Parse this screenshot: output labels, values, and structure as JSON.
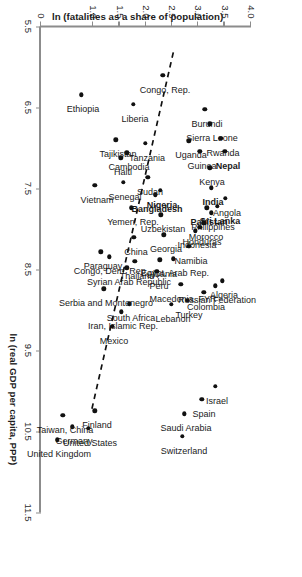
{
  "chart_data": {
    "type": "scatter",
    "title": "",
    "xlabel": "ln (real GDP per capita, PPP)",
    "ylabel": "ln (fatalities as a share of population)",
    "xlim": [
      5.5,
      11.5
    ],
    "ylim": [
      0,
      4.0
    ],
    "xticks": [
      "5.5",
      "6.5",
      "7.5",
      "8.5",
      "9.5",
      "10.5",
      "11.5"
    ],
    "xtick_values": [
      5.5,
      6.5,
      7.5,
      8.5,
      9.5,
      10.5,
      11.5
    ],
    "yticks": [
      "0",
      "1.0",
      "1.5",
      "2.0",
      "2.5",
      "3.0",
      "3.5",
      "4.0"
    ],
    "ytick_values": [
      0,
      1.0,
      1.5,
      2.0,
      2.5,
      3.0,
      3.5,
      4.0
    ],
    "grid": false,
    "legend": "none",
    "trendline": {
      "style": "dashed",
      "x_start": 5.82,
      "y_start": 2.52,
      "x_end": 10.22,
      "y_end": 0.97
    },
    "points": [
      {
        "label": "Burundi",
        "x": 6.52,
        "y": 3.12,
        "lx": 10,
        "ly": -2,
        "bold": false
      },
      {
        "label": "Sierra Leone",
        "x": 6.7,
        "y": 3.22,
        "lx": 10,
        "ly": -2,
        "bold": false
      },
      {
        "label": "Rwanda",
        "x": 6.88,
        "y": 3.43,
        "lx": 10,
        "ly": -2,
        "bold": false
      },
      {
        "label": "Nepal",
        "x": 7.04,
        "y": 3.5,
        "lx": 10,
        "ly": -3,
        "bold": true
      },
      {
        "label": "Uganda",
        "x": 6.91,
        "y": 2.82,
        "lx": 10,
        "ly": -2,
        "bold": false
      },
      {
        "label": "Guinea",
        "x": 7.04,
        "y": 3.02,
        "lx": 10,
        "ly": -2,
        "bold": false
      },
      {
        "label": "Kenya",
        "x": 7.24,
        "y": 3.22,
        "lx": 10,
        "ly": -2,
        "bold": false
      },
      {
        "label": "India",
        "x": 7.49,
        "y": 3.24,
        "lx": 10,
        "ly": -2,
        "bold": true
      },
      {
        "label": "Angola",
        "x": 7.62,
        "y": 3.51,
        "lx": 10,
        "ly": -2,
        "bold": false
      },
      {
        "label": "Sri Lanka",
        "x": 7.72,
        "y": 3.36,
        "lx": 10,
        "ly": -3,
        "bold": true
      },
      {
        "label": "Philippines",
        "x": 7.8,
        "y": 3.24,
        "lx": 10,
        "ly": -2,
        "bold": false
      },
      {
        "label": "Pakistan",
        "x": 7.74,
        "y": 3.16,
        "lx": 10,
        "ly": -2,
        "bold": true
      },
      {
        "label": "Morocco",
        "x": 7.92,
        "y": 3.1,
        "lx": 10,
        "ly": -2,
        "bold": false
      },
      {
        "label": "Honduras",
        "x": 7.98,
        "y": 3.02,
        "lx": 10,
        "ly": -2,
        "bold": false
      },
      {
        "label": "Indonesia",
        "x": 8.02,
        "y": 2.94,
        "lx": 10,
        "ly": -2,
        "bold": false
      },
      {
        "label": "Algeria",
        "x": 8.64,
        "y": 3.45,
        "lx": 10,
        "ly": -2,
        "bold": false
      },
      {
        "label": "Russian Federation",
        "x": 8.7,
        "y": 3.32,
        "lx": 10,
        "ly": -2,
        "bold": false
      },
      {
        "label": "Colombia",
        "x": 8.78,
        "y": 3.1,
        "lx": 10,
        "ly": -2,
        "bold": false
      },
      {
        "label": "Israel",
        "x": 9.94,
        "y": 3.32,
        "lx": 10,
        "ly": -2,
        "bold": false
      },
      {
        "label": "Spain",
        "x": 10.1,
        "y": 3.06,
        "lx": 10,
        "ly": -2,
        "bold": false
      },
      {
        "label": "Saudi Arabia",
        "x": 10.28,
        "y": 2.73,
        "lx": 10,
        "ly": -2,
        "bold": false
      },
      {
        "label": "Switzerland",
        "x": 10.56,
        "y": 2.69,
        "lx": 10,
        "ly": -2,
        "bold": false
      },
      {
        "label": "Namibia",
        "x": 8.21,
        "y": 2.82,
        "lx": 10,
        "ly": -2,
        "bold": false
      },
      {
        "label": "Turkey",
        "x": 8.88,
        "y": 2.79,
        "lx": 10,
        "ly": -2,
        "bold": false
      },
      {
        "label": "Macedonia, FYR",
        "x": 8.68,
        "y": 2.66,
        "lx": 10,
        "ly": -2,
        "bold": false
      },
      {
        "label": "Lebanon",
        "x": 8.93,
        "y": 2.48,
        "lx": 10,
        "ly": -2,
        "bold": false
      },
      {
        "label": "Egypt, Arab Rep.",
        "x": 8.37,
        "y": 2.52,
        "lx": 10,
        "ly": -2,
        "bold": false
      },
      {
        "label": "Georgia",
        "x": 8.07,
        "y": 2.34,
        "lx": 10,
        "ly": -2,
        "bold": false
      },
      {
        "label": "Uzbekistan",
        "x": 7.82,
        "y": 2.28,
        "lx": 10,
        "ly": -2,
        "bold": false
      },
      {
        "label": "Nigeria",
        "x": 7.52,
        "y": 2.27,
        "lx": 10,
        "ly": -2,
        "bold": true
      },
      {
        "label": "Bangladesh",
        "x": 7.58,
        "y": 2.18,
        "lx": 10,
        "ly": -2,
        "bold": true
      },
      {
        "label": "Sudan",
        "x": 7.36,
        "y": 2.03,
        "lx": 10,
        "ly": -2,
        "bold": false
      },
      {
        "label": "Tanzania",
        "x": 6.94,
        "y": 1.99,
        "lx": 10,
        "ly": -2,
        "bold": false
      },
      {
        "label": "Liberia",
        "x": 6.46,
        "y": 1.76,
        "lx": 10,
        "ly": -2,
        "bold": false
      },
      {
        "label": "Congo, Rep.",
        "x": 6.1,
        "y": 2.32,
        "lx": 10,
        "ly": -2,
        "bold": false
      },
      {
        "label": "Cambodia",
        "x": 7.06,
        "y": 1.63,
        "lx": 10,
        "ly": -2,
        "bold": false
      },
      {
        "label": "Haiti",
        "x": 7.12,
        "y": 1.52,
        "lx": 10,
        "ly": -2,
        "bold": false
      },
      {
        "label": "Tajikistan",
        "x": 6.9,
        "y": 1.43,
        "lx": 10,
        "ly": -2,
        "bold": false
      },
      {
        "label": "Senegal",
        "x": 7.42,
        "y": 1.57,
        "lx": 10,
        "ly": -2,
        "bold": false
      },
      {
        "label": "Yemen, Rep.",
        "x": 7.74,
        "y": 1.72,
        "lx": 10,
        "ly": -2,
        "bold": false
      },
      {
        "label": "China",
        "x": 8.1,
        "y": 1.77,
        "lx": 10,
        "ly": -2,
        "bold": false
      },
      {
        "label": "Albania",
        "x": 8.38,
        "y": 2.26,
        "lx": 10,
        "ly": -2,
        "bold": false
      },
      {
        "label": "Peru",
        "x": 8.52,
        "y": 2.21,
        "lx": 10,
        "ly": -2,
        "bold": false
      },
      {
        "label": "Thailand",
        "x": 8.4,
        "y": 1.79,
        "lx": 10,
        "ly": -2,
        "bold": false
      },
      {
        "label": "Syrian Arab Republic",
        "x": 8.48,
        "y": 1.63,
        "lx": 10,
        "ly": -2,
        "bold": false
      },
      {
        "label": "South Africa",
        "x": 8.92,
        "y": 1.68,
        "lx": 10,
        "ly": -2,
        "bold": false
      },
      {
        "label": "Iran, Islamic Rep.",
        "x": 9.02,
        "y": 1.53,
        "lx": 10,
        "ly": -2,
        "bold": false
      },
      {
        "label": "Congo, Dem. Rep.",
        "x": 8.34,
        "y": 1.3,
        "lx": 10,
        "ly": -2,
        "bold": false
      },
      {
        "label": "Paraguay",
        "x": 8.28,
        "y": 1.14,
        "lx": 10,
        "ly": -2,
        "bold": false
      },
      {
        "label": "Mexico",
        "x": 9.2,
        "y": 1.36,
        "lx": 10,
        "ly": -2,
        "bold": false
      },
      {
        "label": "Serbia and Montenegro",
        "x": 8.74,
        "y": 1.2,
        "lx": 10,
        "ly": -2,
        "bold": false
      },
      {
        "label": "Vietnam",
        "x": 7.46,
        "y": 1.03,
        "lx": 10,
        "ly": -2,
        "bold": false
      },
      {
        "label": "Ethiopia",
        "x": 6.34,
        "y": 0.77,
        "lx": 10,
        "ly": -2,
        "bold": false
      },
      {
        "label": "Finland",
        "x": 10.24,
        "y": 1.02,
        "lx": 10,
        "ly": -2,
        "bold": false
      },
      {
        "label": "United States",
        "x": 10.46,
        "y": 0.9,
        "lx": 10,
        "ly": -2,
        "bold": false
      },
      {
        "label": "Germany",
        "x": 10.44,
        "y": 0.6,
        "lx": 10,
        "ly": -2,
        "bold": false
      },
      {
        "label": "Taiwan, China",
        "x": 10.3,
        "y": 0.42,
        "lx": 10,
        "ly": -2,
        "bold": false
      },
      {
        "label": "United Kingdom",
        "x": 10.6,
        "y": 0.31,
        "lx": 10,
        "ly": -2,
        "bold": false
      }
    ]
  }
}
